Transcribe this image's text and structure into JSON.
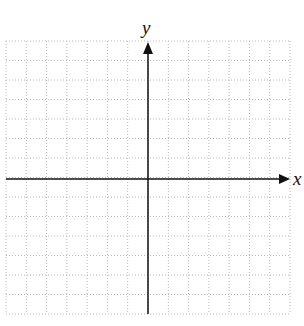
{
  "diagram": {
    "type": "coordinate-plane",
    "grid": {
      "columns": 14,
      "rows": 14,
      "line_style": "dotted",
      "line_color": "#b5b5b5"
    },
    "axes": {
      "x_label": "x",
      "y_label": "y",
      "color": "#111111"
    }
  }
}
